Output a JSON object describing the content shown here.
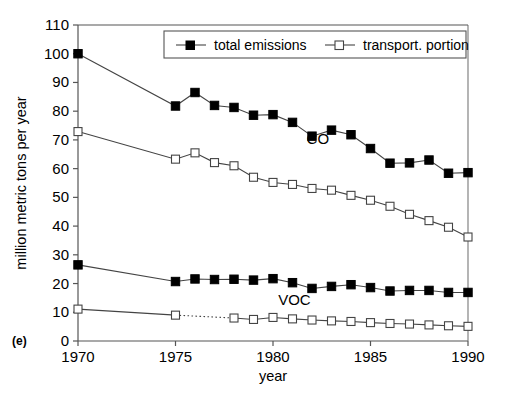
{
  "chart_data": {
    "type": "line",
    "title": "",
    "panel_label": "(e)",
    "xlabel": "year",
    "ylabel": "million metric tons per year",
    "xlim": [
      1970,
      1990
    ],
    "ylim": [
      0,
      110
    ],
    "ytick_step": 10,
    "yticks": [
      0,
      10,
      20,
      30,
      40,
      50,
      60,
      70,
      80,
      90,
      100,
      110
    ],
    "xticks": [
      1970,
      1975,
      1980,
      1985,
      1990
    ],
    "xtick_labels": [
      "1970",
      "1975",
      "1980",
      "1985",
      "1990"
    ],
    "grid": false,
    "legend_position": "top-center",
    "legend": [
      {
        "label": "total emissions",
        "marker": "filled-square"
      },
      {
        "label": "transport. portion",
        "marker": "open-square"
      }
    ],
    "annotations": [
      {
        "text": "CO",
        "x": 1982.3,
        "y": 68.5
      },
      {
        "text": "VOC",
        "x": 1981.1,
        "y": 12.6
      }
    ],
    "groups": [
      {
        "name": "CO",
        "series": [
          {
            "name": "total emissions",
            "marker": "filled-square",
            "x": [
              1970,
              1975,
              1976,
              1977,
              1978,
              1979,
              1980,
              1981,
              1982,
              1983,
              1984,
              1985,
              1986,
              1987,
              1988,
              1989,
              1990
            ],
            "values": [
              100.0,
              81.8,
              86.5,
              82.0,
              81.3,
              78.6,
              78.8,
              76.1,
              71.3,
              73.4,
              71.8,
              67.0,
              61.9,
              62.0,
              63.0,
              58.4,
              58.6
            ]
          },
          {
            "name": "transport. portion",
            "marker": "open-square",
            "x": [
              1970,
              1975,
              1976,
              1977,
              1978,
              1979,
              1980,
              1981,
              1982,
              1983,
              1984,
              1985,
              1986,
              1987,
              1988,
              1989,
              1990
            ],
            "values": [
              72.9,
              63.3,
              65.5,
              62.1,
              61.0,
              57.0,
              55.2,
              54.5,
              53.1,
              52.5,
              50.7,
              49.0,
              46.9,
              44.1,
              41.9,
              39.6,
              36.2
            ]
          }
        ]
      },
      {
        "name": "VOC",
        "series": [
          {
            "name": "total emissions",
            "marker": "filled-square",
            "x": [
              1970,
              1975,
              1976,
              1977,
              1978,
              1979,
              1980,
              1981,
              1982,
              1983,
              1984,
              1985,
              1986,
              1987,
              1988,
              1989,
              1990
            ],
            "values": [
              26.5,
              20.7,
              21.6,
              21.4,
              21.5,
              21.2,
              21.7,
              20.3,
              18.3,
              19.0,
              19.6,
              18.6,
              17.4,
              17.6,
              17.6,
              16.9,
              16.9
            ]
          },
          {
            "name": "transport. portion",
            "marker": "open-square",
            "dotted_from": 1975,
            "dotted_to": 1978,
            "x": [
              1970,
              1975,
              1978,
              1979,
              1980,
              1981,
              1982,
              1983,
              1984,
              1985,
              1986,
              1987,
              1988,
              1989,
              1990
            ],
            "values": [
              11.1,
              9.0,
              8.0,
              7.5,
              8.2,
              7.7,
              7.3,
              7.0,
              6.8,
              6.4,
              6.1,
              5.9,
              5.6,
              5.3,
              5.1
            ]
          }
        ]
      }
    ]
  }
}
